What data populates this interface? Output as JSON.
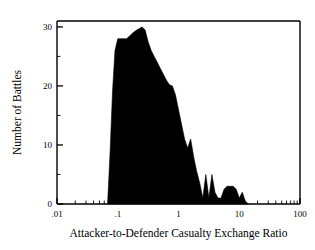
{
  "chart_data": {
    "type": "area",
    "title": "",
    "subtitle": "",
    "xlabel": "Attacker-to-Defender Casualty Exchange Ratio",
    "ylabel": "Number of Battles",
    "xscale": "log",
    "yscale": "linear",
    "xlim": [
      0.01,
      100
    ],
    "ylim": [
      0,
      31
    ],
    "grid": false,
    "legend": null,
    "fill_color": "#000000",
    "axis_color": "#000000",
    "background_color": "#ffffff",
    "xticks": [
      {
        "value": 0.01,
        "label": ".01"
      },
      {
        "value": 0.1,
        "label": ".1"
      },
      {
        "value": 1,
        "label": "1"
      },
      {
        "value": 10,
        "label": "10"
      },
      {
        "value": 100,
        "label": "100"
      }
    ],
    "yticks": [
      {
        "value": 0,
        "label": "0"
      },
      {
        "value": 10,
        "label": "10"
      },
      {
        "value": 20,
        "label": "20"
      },
      {
        "value": 30,
        "label": "30"
      }
    ],
    "yticks_minor": [
      5,
      15,
      25
    ],
    "x": [
      0.068,
      0.075,
      0.082,
      0.09,
      0.1,
      0.112,
      0.125,
      0.14,
      0.158,
      0.178,
      0.2,
      0.224,
      0.251,
      0.282,
      0.316,
      0.355,
      0.398,
      0.447,
      0.501,
      0.562,
      0.631,
      0.708,
      0.794,
      0.891,
      1.0,
      1.122,
      1.259,
      1.413,
      1.585,
      1.778,
      1.995,
      2.239,
      2.512,
      2.818,
      3.162,
      3.548,
      3.981,
      4.467,
      5.012,
      5.623,
      6.31,
      7.079,
      7.943,
      8.913,
      10.0,
      11.22,
      12.589,
      14.125
    ],
    "values": [
      0,
      9,
      19,
      26,
      28,
      28,
      28,
      28,
      28.5,
      29,
      29.4,
      29.7,
      30,
      29.5,
      27.5,
      26,
      25,
      24,
      23,
      22,
      21,
      20.2,
      20,
      18.5,
      16,
      13.5,
      11,
      9.5,
      11,
      8,
      5.5,
      3.5,
      1,
      5,
      1,
      5,
      2,
      1,
      1,
      2.5,
      3,
      3,
      3,
      2.5,
      1,
      2,
      0.5,
      0
    ],
    "annotations": []
  },
  "figure": {
    "xaxis_title": "Attacker-to-Defender Casualty Exchange Ratio",
    "yaxis_title": "Number of Battles"
  }
}
